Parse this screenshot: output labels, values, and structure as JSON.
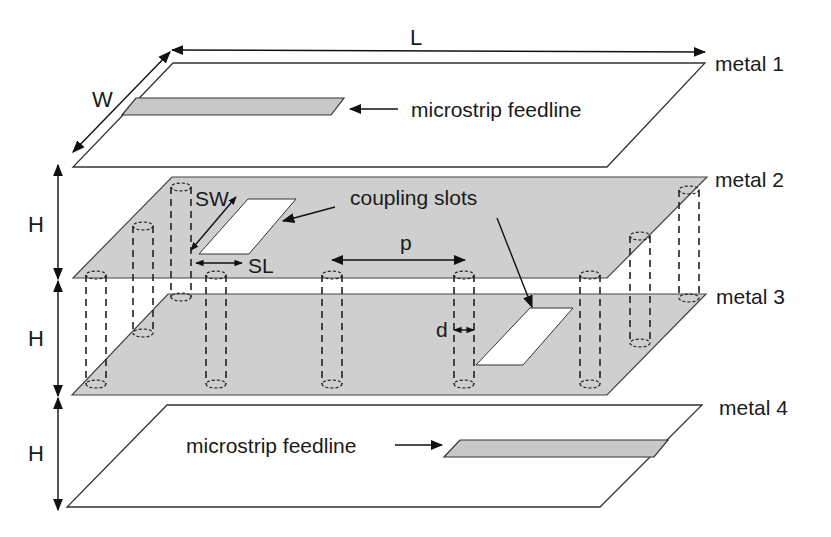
{
  "diagram": {
    "layers": [
      {
        "id": "metal1",
        "label": "metal 1",
        "fill": "#ffffff"
      },
      {
        "id": "metal2",
        "label": "metal 2",
        "fill": "#cfcfcf"
      },
      {
        "id": "metal3",
        "label": "metal 3",
        "fill": "#cfcfcf"
      },
      {
        "id": "metal4",
        "label": "metal 4",
        "fill": "#ffffff"
      }
    ],
    "dimensions": {
      "length": "L",
      "width": "W",
      "height_1": "H",
      "height_2": "H",
      "height_3": "H",
      "slot_width": "SW",
      "slot_length": "SL",
      "via_pitch": "p",
      "via_diameter": "d"
    },
    "annotations": {
      "feedline_top": "microstrip feedline",
      "feedline_bottom": "microstrip feedline",
      "coupling_slots": "coupling slots"
    },
    "colors": {
      "metal_fill": "#cfcfcf",
      "feedline_fill": "#c8c8c8",
      "slot_fill": "#ffffff",
      "line": "#222222"
    }
  }
}
